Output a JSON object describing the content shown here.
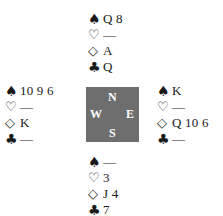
{
  "diagram": {
    "type": "bridge-deal",
    "suit_symbols": {
      "spades": "♠",
      "hearts": "♡",
      "diamonds": "◇",
      "clubs": "♣"
    },
    "compass": {
      "north": "N",
      "south": "S",
      "west": "W",
      "east": "E",
      "color": "#6e6e6e"
    },
    "hands": {
      "north": {
        "spades": "Q 8",
        "hearts": "—",
        "diamonds": "A",
        "clubs": "Q"
      },
      "west": {
        "spades": "10 9 6",
        "hearts": "—",
        "diamonds": "K",
        "clubs": "—"
      },
      "east": {
        "spades": "K",
        "hearts": "—",
        "diamonds": "Q 10 6",
        "clubs": "—"
      },
      "south": {
        "spades": "—",
        "hearts": "3",
        "diamonds": "J 4",
        "clubs": "7"
      }
    }
  }
}
